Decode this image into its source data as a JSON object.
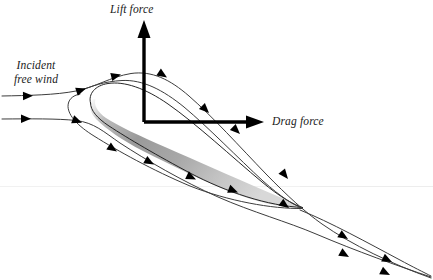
{
  "figure": {
    "name": "airfoil-aerodynamic-forces-diagram",
    "background_color": "#ffffff",
    "width": 433,
    "height": 280
  },
  "labels": {
    "lift_force": "Lift force",
    "drag_force": "Drag force",
    "incident_wind_line1": "Incident",
    "incident_wind_line2": "free wind"
  },
  "colors": {
    "axis": "#000000",
    "streamline": "#3c3c3c",
    "arrowhead": "#000000",
    "airfoil_outline": "#1a1a1a",
    "airfoil_fill_dark": "#8f8f8f",
    "airfoil_fill_light": "#d2d2d2",
    "text": "#1a1a1a",
    "scan_artifact": "#f0f0f0"
  },
  "axes": {
    "origin_x": 144,
    "origin_y": 122,
    "lift_arrow_tip_y": 21,
    "drag_arrow_tip_x": 263,
    "axis_stroke_width": 3.2
  },
  "airfoil": {
    "leading_edge_x": 88,
    "leading_edge_y": 102,
    "trailing_edge_x": 303,
    "trailing_edge_y": 207,
    "chord_angle_deg": 26,
    "description": "thin cambered airfoil, rounded leading edge upper-left, tapering trailing edge lower-right"
  },
  "streamlines": {
    "count": 4,
    "upper_inlet_y": 96,
    "lower_inlet_y": 119,
    "upper_outlet_y": 246,
    "lower_outlet_y": 272,
    "arrowhead_count": 16
  }
}
